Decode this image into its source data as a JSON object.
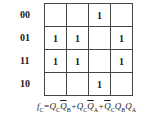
{
  "kmap": {
    "row_labels": [
      "00",
      "01",
      "11",
      "10"
    ],
    "cells": [
      [
        "",
        "",
        "1",
        ""
      ],
      [
        "1",
        "1",
        "",
        "1"
      ],
      [
        "1",
        "1",
        "",
        "1"
      ],
      [
        "",
        "",
        "1",
        ""
      ]
    ]
  },
  "formula": {
    "lhs": "f",
    "lhs_sub": "C",
    "eq": "=",
    "terms": [
      {
        "parts": [
          {
            "var": "Q",
            "sub": "C",
            "bar": false
          },
          {
            "var": "Q",
            "sub": "B",
            "bar": true
          }
        ]
      },
      {
        "parts": [
          {
            "var": "Q",
            "sub": "C",
            "bar": false
          },
          {
            "var": "Q",
            "sub": "A",
            "bar": true
          }
        ]
      },
      {
        "parts": [
          {
            "var": "Q",
            "sub": "C",
            "bar": true
          },
          {
            "var": "Q",
            "sub": "B",
            "bar": false
          },
          {
            "var": "Q",
            "sub": "A",
            "bar": false
          }
        ]
      }
    ],
    "plus": "+"
  }
}
